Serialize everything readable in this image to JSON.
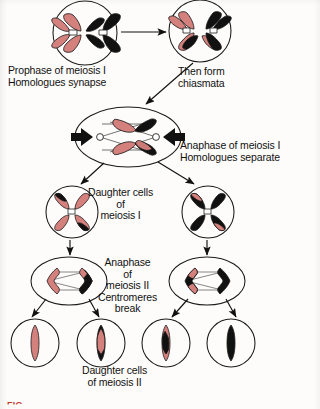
{
  "figure": {
    "caption_partial": "FIG.",
    "background_color": "#fdfcfa",
    "chromosome_colors": {
      "maternal": "#d4817e",
      "paternal": "#111111",
      "outline": "#1a1a1a",
      "centromere": "#ffffff"
    }
  },
  "labels": [
    {
      "id": "prophase-i",
      "lines": [
        "Prophase of meiosis I",
        "Homologues synapse"
      ],
      "x": 8,
      "y": 65,
      "align": "left"
    },
    {
      "id": "chiasmata",
      "lines": [
        "Then form",
        "chiasmata"
      ],
      "x": 178,
      "y": 66,
      "align": "left"
    },
    {
      "id": "anaphase-i",
      "lines": [
        "Anaphase of meiosis I",
        "Homologues separate"
      ],
      "x": 180,
      "y": 140,
      "align": "left"
    },
    {
      "id": "daughter-cells-i",
      "lines": [
        "Daughter cells",
        "of",
        "meiosis I"
      ],
      "x": 88,
      "y": 187,
      "align": "center"
    },
    {
      "id": "anaphase-ii",
      "lines": [
        "Anaphase",
        "of",
        "meiosis II",
        "Centromeres",
        "break"
      ],
      "x": 98,
      "y": 257,
      "align": "center"
    },
    {
      "id": "daughter-cells-ii",
      "lines": [
        "Daughter cells",
        "of meiosis II"
      ],
      "x": 82,
      "y": 365,
      "align": "center"
    }
  ],
  "cells": [
    {
      "id": "cell-prophase-i",
      "stage": "Prophase of meiosis I",
      "shape": "circle",
      "cx": 85,
      "cy": 33,
      "r": 32,
      "contents": "two X-shaped homologous chromosomes side by side, one pink one black, synapsed"
    },
    {
      "id": "cell-chiasmata",
      "stage": "Chiasmata formation",
      "shape": "circle",
      "cx": 200,
      "cy": 31,
      "r": 31,
      "contents": "homologues overlapping with crossovers, arms exchanged"
    },
    {
      "id": "cell-anaphase-i",
      "stage": "Anaphase of meiosis I",
      "shape": "ellipse",
      "cx": 128,
      "cy": 137,
      "rx": 53,
      "ry": 30,
      "contents": "two V-shaped recombinant chromosomes moving to opposite poles with spindle fibers and pole arrows"
    },
    {
      "id": "cell-daughter-i-left",
      "stage": "Daughter cell of meiosis I",
      "shape": "circle",
      "cx": 72,
      "cy": 212,
      "r": 26,
      "contents": "X-shaped chromosome mostly pink with black arm tips"
    },
    {
      "id": "cell-daughter-i-right",
      "stage": "Daughter cell of meiosis I",
      "shape": "circle",
      "cx": 208,
      "cy": 212,
      "r": 26,
      "contents": "X-shaped chromosome mostly black with pink arm tips"
    },
    {
      "id": "cell-anaphase-ii-left",
      "stage": "Anaphase of meiosis II",
      "shape": "ellipse",
      "cx": 69,
      "cy": 281,
      "rx": 38,
      "ry": 24,
      "contents": "two pink chevrons with black tips separating, centromeres broken"
    },
    {
      "id": "cell-anaphase-ii-right",
      "stage": "Anaphase of meiosis II",
      "shape": "ellipse",
      "cx": 207,
      "cy": 281,
      "rx": 38,
      "ry": 24,
      "contents": "two black chevrons with pink tips separating, centromeres broken"
    },
    {
      "id": "gamete-1",
      "stage": "Daughter cell of meiosis II",
      "shape": "circle",
      "cx": 35,
      "cy": 343,
      "r": 24,
      "contents": "single rod chromosome, all pink"
    },
    {
      "id": "gamete-2",
      "stage": "Daughter cell of meiosis II",
      "shape": "circle",
      "cx": 101,
      "cy": 343,
      "r": 24,
      "contents": "single rod chromosome, black with pink middle segment"
    },
    {
      "id": "gamete-3",
      "stage": "Daughter cell of meiosis II",
      "shape": "circle",
      "cx": 166,
      "cy": 343,
      "r": 24,
      "contents": "single rod chromosome, pink with black middle segment"
    },
    {
      "id": "gamete-4",
      "stage": "Daughter cell of meiosis II",
      "shape": "circle",
      "cx": 231,
      "cy": 343,
      "r": 24,
      "contents": "single rod chromosome, all black"
    }
  ],
  "arrows": [
    {
      "id": "arrow-prophase-to-chiasmata",
      "from": "cell-prophase-i",
      "to": "cell-chiasmata"
    },
    {
      "id": "arrow-chiasmata-to-anaphase-i",
      "from": "cell-chiasmata",
      "to": "cell-anaphase-i"
    },
    {
      "id": "arrow-anaphase-i-to-daughter-left",
      "from": "cell-anaphase-i",
      "to": "cell-daughter-i-left"
    },
    {
      "id": "arrow-anaphase-i-to-daughter-right",
      "from": "cell-anaphase-i",
      "to": "cell-daughter-i-right"
    },
    {
      "id": "arrow-daughter-left-to-anaphase-ii",
      "from": "cell-daughter-i-left",
      "to": "cell-anaphase-ii-left"
    },
    {
      "id": "arrow-daughter-right-to-anaphase-ii",
      "from": "cell-daughter-i-right",
      "to": "cell-anaphase-ii-right"
    },
    {
      "id": "arrow-anaphase-ii-left-to-gamete-1",
      "from": "cell-anaphase-ii-left",
      "to": "gamete-1"
    },
    {
      "id": "arrow-anaphase-ii-left-to-gamete-2",
      "from": "cell-anaphase-ii-left",
      "to": "gamete-2"
    },
    {
      "id": "arrow-anaphase-ii-right-to-gamete-3",
      "from": "cell-anaphase-ii-right",
      "to": "gamete-3"
    },
    {
      "id": "arrow-anaphase-ii-right-to-gamete-4",
      "from": "cell-anaphase-ii-right",
      "to": "gamete-4"
    }
  ]
}
